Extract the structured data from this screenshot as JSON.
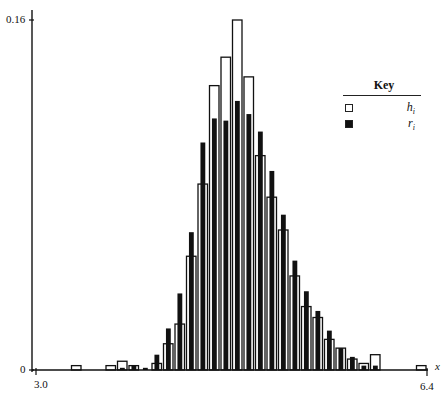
{
  "chart_data": {
    "type": "bar",
    "title": "",
    "xlabel": "x",
    "ylabel": "",
    "xlim": [
      3.0,
      6.4
    ],
    "ylim": [
      0,
      0.16
    ],
    "x_ticks": [
      "3.0",
      "6.4"
    ],
    "y_ticks": [
      "0",
      "0.16"
    ],
    "grid": false,
    "legend_position": "upper right",
    "legend_title": "Key",
    "bin_width": 0.1,
    "x": [
      3.35,
      3.65,
      3.75,
      3.85,
      3.95,
      4.05,
      4.15,
      4.25,
      4.35,
      4.45,
      4.55,
      4.65,
      4.75,
      4.85,
      4.95,
      5.05,
      5.15,
      5.25,
      5.35,
      5.45,
      5.55,
      5.65,
      5.75,
      5.85,
      5.95,
      6.05,
      6.35
    ],
    "series": [
      {
        "name": "h_i",
        "style": "hollow",
        "values": [
          0.002,
          0.002,
          0.004,
          0.002,
          0.0,
          0.003,
          0.012,
          0.021,
          0.052,
          0.085,
          0.13,
          0.143,
          0.16,
          0.134,
          0.098,
          0.079,
          0.064,
          0.043,
          0.029,
          0.024,
          0.014,
          0.01,
          0.005,
          0.003,
          0.007,
          0.0,
          0.002
        ]
      },
      {
        "name": "r_i",
        "style": "filled",
        "values": [
          0.0,
          0.0,
          0.001,
          0.002,
          0.001,
          0.007,
          0.019,
          0.035,
          0.063,
          0.104,
          0.115,
          0.114,
          0.123,
          0.117,
          0.109,
          0.091,
          0.071,
          0.05,
          0.036,
          0.027,
          0.018,
          0.01,
          0.006,
          0.002,
          0.002,
          0.0,
          0.0
        ]
      }
    ]
  },
  "axes": {
    "x_min_label": "3.0",
    "x_max_label": "6.4",
    "y_zero_label": "0",
    "y_max_label": "0.16",
    "x_axis_name": "x"
  },
  "legend": {
    "title": "Key",
    "items": [
      {
        "label": "h",
        "sub": "i",
        "style": "hollow"
      },
      {
        "label": "r",
        "sub": "i",
        "style": "filled"
      }
    ]
  }
}
